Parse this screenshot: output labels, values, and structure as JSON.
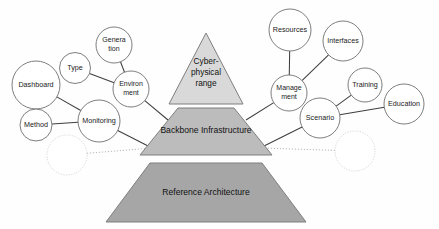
{
  "diagram": {
    "type": "node-link-pyramid-diagram",
    "canvas": {
      "width": 439,
      "height": 229,
      "background": "#fefefe"
    },
    "colors": {
      "apex_fill": "#d9d9d9",
      "middle_fill": "#bcbcbc",
      "base_fill": "#a6a6a6",
      "shape_stroke": "#7f7f7f",
      "circle_stroke": "#6f6f6f",
      "ghost_circle_stroke": "#c9c9c9",
      "link_stroke": "#3f3f3f",
      "dotted_link_stroke": "#b0b0b0",
      "text": "#1a1a1a"
    },
    "pyramid": {
      "apex": {
        "name": "cyber-physical-range",
        "lines": [
          "Cyber-",
          "physical",
          "range"
        ],
        "text": "Cyber-physical range"
      },
      "middle": {
        "name": "backbone-infrastructure",
        "lines": [
          "Backbone Infrastructure"
        ],
        "text": "Backbone Infrastructure"
      },
      "base": {
        "name": "reference-architecture",
        "lines": [
          "Reference Architecture"
        ],
        "text": "Reference Architecture"
      }
    },
    "nodes": [
      {
        "id": "dashboard",
        "label": "Dashboard",
        "lines": [
          "Dashboard"
        ],
        "cx": 36,
        "cy": 85,
        "r": 24,
        "font": 7.2,
        "ghost": false
      },
      {
        "id": "type",
        "label": "Type",
        "lines": [
          "Type"
        ],
        "cx": 75,
        "cy": 68,
        "r": 15.5,
        "font": 7.2,
        "ghost": false
      },
      {
        "id": "generation",
        "label": "Generation",
        "lines": [
          "Genera",
          "tion"
        ],
        "cx": 114,
        "cy": 45,
        "r": 18,
        "font": 7.0,
        "ghost": false
      },
      {
        "id": "environment",
        "label": "Environment",
        "lines": [
          "Environ",
          "ment"
        ],
        "cx": 131,
        "cy": 89,
        "r": 18,
        "font": 7.0,
        "ghost": false
      },
      {
        "id": "method",
        "label": "Method",
        "lines": [
          "Method"
        ],
        "cx": 36,
        "cy": 125,
        "r": 16,
        "font": 7.2,
        "ghost": false
      },
      {
        "id": "monitoring",
        "label": "Monitoring",
        "lines": [
          "Monitoring"
        ],
        "cx": 99,
        "cy": 121,
        "r": 21,
        "font": 7.2,
        "ghost": false
      },
      {
        "id": "ghost-left",
        "label": "",
        "lines": [],
        "cx": 67,
        "cy": 155,
        "r": 20,
        "font": 7.2,
        "ghost": true
      },
      {
        "id": "resources",
        "label": "Resources",
        "lines": [
          "Resources"
        ],
        "cx": 290,
        "cy": 30,
        "r": 21,
        "font": 7.2,
        "ghost": false
      },
      {
        "id": "interfaces",
        "label": "Interfaces",
        "lines": [
          "Interfaces"
        ],
        "cx": 343,
        "cy": 41,
        "r": 20,
        "font": 7.2,
        "ghost": false
      },
      {
        "id": "management",
        "label": "Management",
        "lines": [
          "Manage",
          "ment"
        ],
        "cx": 289,
        "cy": 93,
        "r": 18,
        "font": 7.0,
        "ghost": false
      },
      {
        "id": "training",
        "label": "Training",
        "lines": [
          "Training"
        ],
        "cx": 365,
        "cy": 85,
        "r": 17,
        "font": 7.2,
        "ghost": false
      },
      {
        "id": "education",
        "label": "Education",
        "lines": [
          "Education"
        ],
        "cx": 404,
        "cy": 104,
        "r": 20,
        "font": 7.2,
        "ghost": false
      },
      {
        "id": "scenario",
        "label": "Scenario",
        "lines": [
          "Scenario"
        ],
        "cx": 320,
        "cy": 118,
        "r": 20,
        "font": 7.2,
        "ghost": false
      },
      {
        "id": "ghost-right",
        "label": "",
        "lines": [],
        "cx": 355,
        "cy": 151,
        "r": 20,
        "font": 7.2,
        "ghost": true
      }
    ],
    "links": [
      {
        "id": "link-dashboard-monitoring",
        "from": "dashboard",
        "to": "monitoring",
        "style": "solid"
      },
      {
        "id": "link-method-monitoring",
        "from": "method",
        "to": "monitoring",
        "style": "solid"
      },
      {
        "id": "link-type-environment",
        "from": "type",
        "to": "environment",
        "style": "solid"
      },
      {
        "id": "link-generation-environment",
        "from": "generation",
        "to": "environment",
        "style": "solid"
      },
      {
        "id": "link-environment-backbone",
        "from": "environment",
        "to": "backbone-infrastructure",
        "style": "solid"
      },
      {
        "id": "link-monitoring-backbone",
        "from": "monitoring",
        "to": "backbone-infrastructure",
        "style": "solid"
      },
      {
        "id": "link-ghostleft-backbone",
        "from": "ghost-left",
        "to": "backbone-infrastructure",
        "style": "dotted"
      },
      {
        "id": "link-resources-management",
        "from": "resources",
        "to": "management",
        "style": "solid"
      },
      {
        "id": "link-interfaces-management",
        "from": "interfaces",
        "to": "management",
        "style": "solid"
      },
      {
        "id": "link-management-backbone",
        "from": "management",
        "to": "backbone-infrastructure",
        "style": "solid"
      },
      {
        "id": "link-training-scenario",
        "from": "training",
        "to": "scenario",
        "style": "solid"
      },
      {
        "id": "link-education-scenario",
        "from": "education",
        "to": "scenario",
        "style": "solid"
      },
      {
        "id": "link-scenario-backbone",
        "from": "scenario",
        "to": "backbone-infrastructure",
        "style": "solid"
      },
      {
        "id": "link-ghostright-backbone",
        "from": "ghost-right",
        "to": "backbone-infrastructure",
        "style": "dotted"
      }
    ]
  }
}
